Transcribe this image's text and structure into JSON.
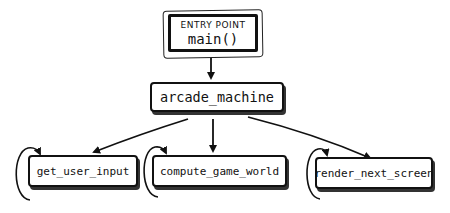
{
  "diagram": {
    "entry": {
      "kicker": "ENTRY POINT",
      "title": "main()"
    },
    "root": {
      "label": "arcade_machine"
    },
    "children": [
      {
        "label": "get_user_input",
        "loops": true
      },
      {
        "label": "compute_game_world",
        "loops": true
      },
      {
        "label": "render_next_screen",
        "loops": true
      }
    ],
    "edges": [
      {
        "from": "main()",
        "to": "arcade_machine"
      },
      {
        "from": "arcade_machine",
        "to": "get_user_input"
      },
      {
        "from": "arcade_machine",
        "to": "compute_game_world"
      },
      {
        "from": "arcade_machine",
        "to": "render_next_screen"
      }
    ],
    "colors": {
      "ink": "#111111",
      "background": "#ffffff"
    }
  }
}
